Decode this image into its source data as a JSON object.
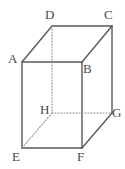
{
  "figure": {
    "name": "labeled-rectangular-prism",
    "shape_type": "cuboid",
    "projection": "oblique",
    "background_color": "#ffffff",
    "solid_edge_color": "#5a5a5a",
    "hidden_edge_color": "#8a8a8a",
    "label_color": "#4a4a4a",
    "solid_edge_width": 1.4,
    "hidden_edge_width": 1.1,
    "hidden_edge_dash": "1,2"
  },
  "vertices": [
    {
      "id": "A",
      "label": "A",
      "x": 22,
      "y": 62,
      "label_x": 8,
      "label_y": 52,
      "hidden": false
    },
    {
      "id": "B",
      "label": "B",
      "x": 82,
      "y": 62,
      "label_x": 83,
      "label_y": 62,
      "hidden": false
    },
    {
      "id": "C",
      "label": "C",
      "x": 112,
      "y": 26,
      "label_x": 104,
      "label_y": 8,
      "hidden": false
    },
    {
      "id": "D",
      "label": "D",
      "x": 52,
      "y": 26,
      "label_x": 45,
      "label_y": 8,
      "hidden": false
    },
    {
      "id": "E",
      "label": "E",
      "x": 22,
      "y": 148,
      "label_x": 12,
      "label_y": 150,
      "hidden": false
    },
    {
      "id": "F",
      "label": "F",
      "x": 82,
      "y": 148,
      "label_x": 77,
      "label_y": 150,
      "hidden": false
    },
    {
      "id": "G",
      "label": "G",
      "x": 112,
      "y": 113,
      "label_x": 112,
      "label_y": 106,
      "hidden": false
    },
    {
      "id": "H",
      "label": "H",
      "x": 52,
      "y": 113,
      "label_x": 40,
      "label_y": 103,
      "hidden": true
    }
  ],
  "edges": [
    {
      "id": "AB",
      "from": "A",
      "to": "B",
      "style": "solid",
      "face": "front-top"
    },
    {
      "id": "BF",
      "from": "B",
      "to": "F",
      "style": "solid",
      "face": "front-right"
    },
    {
      "id": "FE",
      "from": "F",
      "to": "E",
      "style": "solid",
      "face": "front-bottom"
    },
    {
      "id": "EA",
      "from": "E",
      "to": "A",
      "style": "solid",
      "face": "front-left"
    },
    {
      "id": "DC",
      "from": "D",
      "to": "C",
      "style": "solid",
      "face": "top-back"
    },
    {
      "id": "AD",
      "from": "A",
      "to": "D",
      "style": "solid",
      "face": "top-left"
    },
    {
      "id": "BC",
      "from": "B",
      "to": "C",
      "style": "solid",
      "face": "top-right"
    },
    {
      "id": "CG",
      "from": "C",
      "to": "G",
      "style": "solid",
      "face": "right-back"
    },
    {
      "id": "FG",
      "from": "F",
      "to": "G",
      "style": "solid",
      "face": "bottom-right"
    },
    {
      "id": "DH",
      "from": "D",
      "to": "H",
      "style": "dotted",
      "face": "hidden-vertical"
    },
    {
      "id": "HG",
      "from": "H",
      "to": "G",
      "style": "dotted",
      "face": "hidden-back-bottom"
    },
    {
      "id": "HE",
      "from": "H",
      "to": "E",
      "style": "dotted",
      "face": "hidden-back-left"
    }
  ]
}
